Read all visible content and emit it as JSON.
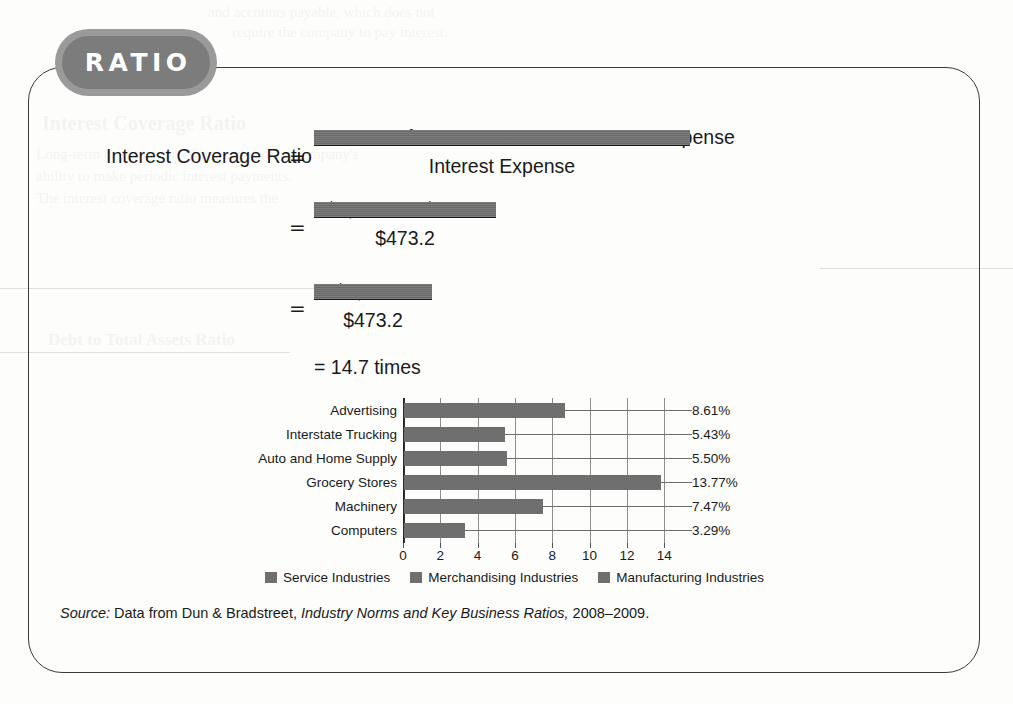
{
  "badge": {
    "label": "RATIO"
  },
  "formula": {
    "title": "Interest Coverage Ratio",
    "equals": "=",
    "line1": {
      "numerator": "Income Before Income Taxes + Interest Expense",
      "denominator": "Interest Expense"
    },
    "line2": {
      "numerator": "$6,487.0 + $473.2",
      "denominator": "$473.2"
    },
    "line3": {
      "numerator": "$6,960.2",
      "denominator": "$473.2"
    },
    "result": "= 14.7 times"
  },
  "source": {
    "prefix": "Source:",
    "text": "Data from Dun & Bradstreet,",
    "publication": "Industry Norms and Key Business Ratios,",
    "years": "2008–2009."
  },
  "chart_data": {
    "type": "bar",
    "orientation": "horizontal",
    "title": "",
    "xlabel": "",
    "ylabel": "",
    "xlim": [
      0,
      14.9
    ],
    "xticks": [
      0,
      2,
      4,
      6,
      8,
      10,
      12,
      14
    ],
    "grid": true,
    "categories": [
      "Advertising",
      "Interstate Trucking",
      "Auto and Home Supply",
      "Grocery Stores",
      "Machinery",
      "Computers"
    ],
    "values": [
      8.61,
      5.43,
      5.5,
      13.77,
      7.47,
      3.29
    ],
    "value_labels": [
      "8.61%",
      "5.43%",
      "5.50%",
      "13.77%",
      "7.47%",
      "3.29%"
    ],
    "legend_position": "bottom",
    "legend": [
      "Service Industries",
      "Merchandising Industries",
      "Manufacturing Industries"
    ],
    "colors": {
      "bar": "#6f6f6f",
      "grid": "#8d8d8d",
      "axis": "#2a2a2a"
    }
  },
  "theme": {
    "badge_fill": "#7c7c7c",
    "badge_ring": "#9a9a9a",
    "card_border": "#3a3a3a",
    "text": "#1a1a1a",
    "page_bg": "#fdfdfc"
  }
}
